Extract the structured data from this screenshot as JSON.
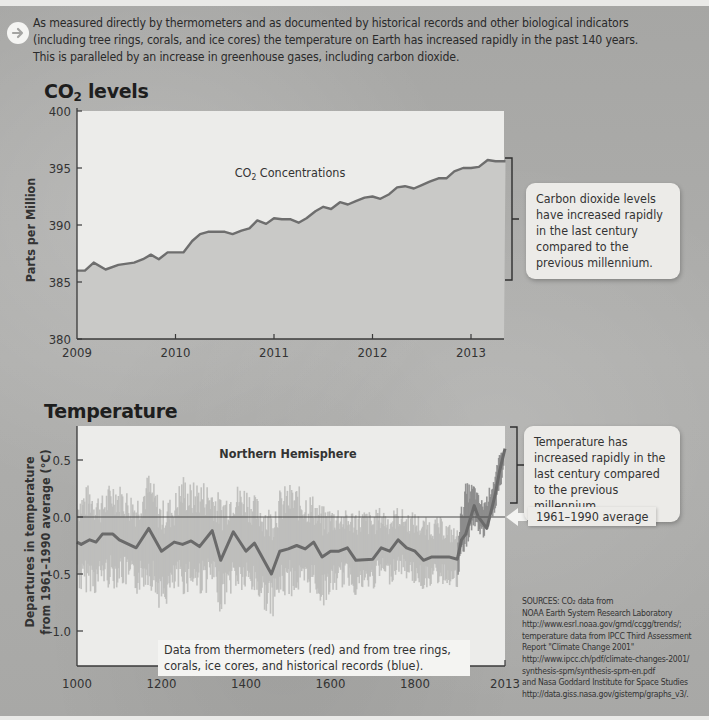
{
  "intro": {
    "icon": "arrow-right-circle-icon",
    "line1": "As measured directly by thermometers and as documented by historical records and other biological indicators",
    "line2": "(including tree rings, corals, and ice cores) the temperature on Earth has increased rapidly in the past 140 years.",
    "line3": "This is paralleled by an increase in greenhouse gases, including carbon dioxide."
  },
  "co2_section": {
    "title_main": "CO",
    "title_sub": "2",
    "title_rest": " levels",
    "callout": "Carbon dioxide levels have increased rapidly in the last century compared to the previous millennium."
  },
  "temp_section": {
    "title": "Temperature",
    "callout": "Temperature has increased rapidly in the last century compared to the previous millennium.",
    "avg_label": "1961–1990 average",
    "note_line1": "Data from thermometers (red) and from tree rings,",
    "note_line2": "corals, ice cores, and historical records (blue)."
  },
  "sources": {
    "line1": "SOURCES: CO₂ data from",
    "line2": "NOAA Earth System Research Laboratory",
    "line3": "http://www.esrl.noaa.gov/gmd/ccgg/trends/;",
    "line4": "temperature data from IPCC Third Assessment",
    "line5": "Report \"Climate Change 2001\"",
    "line6": "http://www.ipcc.ch/pdf/climate-changes-2001/",
    "line7": "synthesis-spm/synthesis-spm-en.pdf",
    "line8": "and Nasa Goddard Institute for Space Studies",
    "line9": "http://data.giss.nasa.gov/gistemp/graphs_v3/."
  },
  "colors": {
    "plot_bg": "#ececea",
    "co2_fill": "#c9c9c7",
    "co2_line": "#6e6e6e",
    "temp_band": "#bdbdbb",
    "temp_line": "#6a6a6a",
    "axis": "#3a3a3a"
  },
  "chart_data": [
    {
      "type": "area",
      "title": "CO2 levels",
      "annotation": "CO₂ Concentrations",
      "xlabel": "",
      "ylabel": "Parts per Million",
      "xlim": [
        2009,
        2013.35
      ],
      "ylim": [
        380,
        400
      ],
      "x_ticks": [
        "2009",
        "2010",
        "2011",
        "2012",
        "2013"
      ],
      "y_ticks": [
        "380",
        "385",
        "390",
        "395",
        "400"
      ],
      "grid": false,
      "series": [
        {
          "name": "CO2 Concentrations",
          "x": [
            2009.0,
            2009.08,
            2009.17,
            2009.29,
            2009.42,
            2009.58,
            2009.67,
            2009.75,
            2009.83,
            2009.92,
            2010.0,
            2010.08,
            2010.17,
            2010.25,
            2010.33,
            2010.42,
            2010.5,
            2010.58,
            2010.67,
            2010.75,
            2010.83,
            2010.92,
            2011.0,
            2011.08,
            2011.17,
            2011.25,
            2011.33,
            2011.42,
            2011.5,
            2011.58,
            2011.67,
            2011.75,
            2011.83,
            2011.92,
            2012.0,
            2012.08,
            2012.17,
            2012.25,
            2012.33,
            2012.42,
            2012.5,
            2012.58,
            2012.67,
            2012.75,
            2012.83,
            2012.92,
            2013.0,
            2013.08,
            2013.17,
            2013.25,
            2013.35
          ],
          "values": [
            386.0,
            386.0,
            386.7,
            386.1,
            386.5,
            386.7,
            387.0,
            387.4,
            387.0,
            387.6,
            387.6,
            387.6,
            388.6,
            389.2,
            389.4,
            389.4,
            389.4,
            389.2,
            389.5,
            389.7,
            390.4,
            390.1,
            390.6,
            390.5,
            390.5,
            390.2,
            390.6,
            391.2,
            391.6,
            391.4,
            392.0,
            391.8,
            392.1,
            392.4,
            392.5,
            392.3,
            392.7,
            393.3,
            393.4,
            393.2,
            393.5,
            393.8,
            394.1,
            394.1,
            394.7,
            395.0,
            395.0,
            395.1,
            395.7,
            395.6,
            395.6
          ]
        }
      ],
      "legend": "none"
    },
    {
      "type": "line",
      "title": "Temperature",
      "annotation": "Northern Hemisphere",
      "xlabel": "",
      "ylabel": "Departures in temperature from 1961–1990 average (°C)",
      "xlim": [
        1000,
        2013
      ],
      "ylim": [
        -1.25,
        0.75
      ],
      "x_ticks": [
        "1000",
        "1200",
        "1400",
        "1600",
        "1800",
        "2013"
      ],
      "y_ticks": [
        "-1.0",
        "-0.5",
        "0.0",
        "0.5"
      ],
      "reference_line": {
        "y": 0.0,
        "label": "1961–1990 average"
      },
      "grid": false,
      "series": [
        {
          "name": "Smoothed reconstruction (tree rings, corals, ice cores, historical records) + thermometers",
          "x": [
            1000,
            1010,
            1030,
            1045,
            1060,
            1085,
            1100,
            1140,
            1170,
            1200,
            1230,
            1250,
            1270,
            1290,
            1320,
            1340,
            1370,
            1400,
            1420,
            1460,
            1480,
            1500,
            1520,
            1540,
            1560,
            1580,
            1600,
            1620,
            1640,
            1660,
            1700,
            1720,
            1740,
            1760,
            1780,
            1800,
            1820,
            1840,
            1860,
            1880,
            1900,
            1910,
            1920,
            1940,
            1950,
            1960,
            1970,
            1980,
            1990,
            2000,
            2013
          ],
          "values": [
            -0.22,
            -0.24,
            -0.2,
            -0.22,
            -0.15,
            -0.15,
            -0.2,
            -0.27,
            -0.1,
            -0.3,
            -0.22,
            -0.24,
            -0.21,
            -0.26,
            -0.12,
            -0.38,
            -0.13,
            -0.3,
            -0.23,
            -0.5,
            -0.3,
            -0.28,
            -0.25,
            -0.28,
            -0.22,
            -0.35,
            -0.3,
            -0.3,
            -0.27,
            -0.38,
            -0.37,
            -0.27,
            -0.3,
            -0.2,
            -0.27,
            -0.3,
            -0.38,
            -0.35,
            -0.35,
            -0.35,
            -0.37,
            -0.2,
            -0.15,
            0.1,
            0.0,
            -0.05,
            -0.1,
            0.05,
            0.2,
            0.4,
            0.6
          ]
        },
        {
          "name": "Uncertainty band (approx.)",
          "upper": [
            0.2,
            0.25,
            0.3,
            0.25,
            0.2,
            0.35,
            0.3,
            0.2,
            0.4,
            0.15,
            0.2,
            0.4,
            0.3,
            0.35,
            0.3,
            0.2,
            0.3,
            0.3,
            0.2,
            0.1,
            0.25,
            0.3,
            0.28,
            0.25,
            0.2,
            0.1,
            0.1,
            0.12,
            0.05,
            0.1,
            0.05,
            0.1,
            0.05,
            0.1,
            0.05,
            0.05,
            0.0,
            0.0,
            0.0,
            -0.05,
            -0.1,
            0.1,
            0.3,
            0.3,
            0.2,
            0.15,
            0.2,
            0.3,
            0.4,
            0.55,
            0.7
          ],
          "lower": [
            -0.6,
            -0.7,
            -0.65,
            -0.7,
            -0.6,
            -0.65,
            -0.6,
            -0.7,
            -0.6,
            -0.85,
            -0.7,
            -0.7,
            -0.65,
            -0.7,
            -0.65,
            -0.85,
            -0.65,
            -0.7,
            -0.7,
            -0.9,
            -0.75,
            -0.7,
            -0.7,
            -0.72,
            -0.65,
            -0.8,
            -0.7,
            -0.65,
            -0.6,
            -0.7,
            -0.65,
            -0.55,
            -0.6,
            -0.5,
            -0.55,
            -0.6,
            -0.65,
            -0.6,
            -0.6,
            -0.6,
            -0.65,
            -0.4,
            -0.3,
            -0.1,
            -0.15,
            -0.2,
            -0.2,
            -0.05,
            0.05,
            0.2,
            0.4
          ]
        }
      ],
      "legend": "none"
    }
  ]
}
